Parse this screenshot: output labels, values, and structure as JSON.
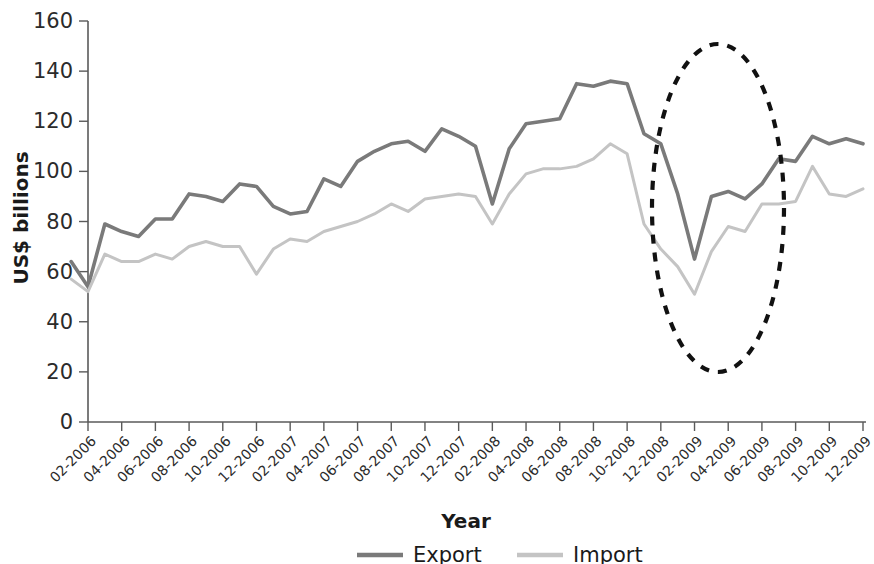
{
  "chart_data": {
    "type": "line",
    "title": "",
    "xlabel": "Year",
    "ylabel": "US$ billions",
    "ylim": [
      0,
      160
    ],
    "yticks": [
      0,
      20,
      40,
      60,
      80,
      100,
      120,
      140,
      160
    ],
    "grid": false,
    "legend_position": "bottom",
    "x": [
      "01-2006",
      "02-2006",
      "03-2006",
      "04-2006",
      "05-2006",
      "06-2006",
      "07-2006",
      "08-2006",
      "09-2006",
      "10-2006",
      "11-2006",
      "12-2006",
      "01-2007",
      "02-2007",
      "03-2007",
      "04-2007",
      "05-2007",
      "06-2007",
      "07-2007",
      "08-2007",
      "09-2007",
      "10-2007",
      "11-2007",
      "12-2007",
      "01-2008",
      "02-2008",
      "03-2008",
      "04-2008",
      "05-2008",
      "06-2008",
      "07-2008",
      "08-2008",
      "09-2008",
      "10-2008",
      "11-2008",
      "12-2008",
      "01-2009",
      "02-2009",
      "03-2009",
      "04-2009",
      "05-2009",
      "06-2009",
      "07-2009",
      "08-2009",
      "09-2009",
      "10-2009",
      "11-2009",
      "12-2009"
    ],
    "xtick_labels": [
      "02-2006",
      "04-2006",
      "06-2006",
      "08-2006",
      "10-2006",
      "12-2006",
      "02-2007",
      "04-2007",
      "06-2007",
      "08-2007",
      "10-2007",
      "12-2007",
      "02-2008",
      "04-2008",
      "06-2008",
      "08-2008",
      "10-2008",
      "12-2008",
      "02-2009",
      "04-2009",
      "06-2009",
      "08-2009",
      "10-2009",
      "12-2009"
    ],
    "series": [
      {
        "name": "Export",
        "color": "#7a7a7a",
        "values": [
          64,
          54,
          79,
          76,
          74,
          81,
          81,
          91,
          90,
          88,
          95,
          94,
          86,
          83,
          84,
          97,
          94,
          104,
          108,
          111,
          112,
          108,
          117,
          114,
          110,
          87,
          109,
          119,
          120,
          121,
          135,
          134,
          136,
          135,
          115,
          111,
          91,
          65,
          90,
          92,
          89,
          95,
          105,
          104,
          114,
          111,
          113,
          111
        ]
      },
      {
        "name": "Import",
        "color": "#c4c4c4",
        "values": [
          57,
          52,
          67,
          64,
          64,
          67,
          65,
          70,
          72,
          70,
          70,
          59,
          69,
          73,
          72,
          76,
          78,
          80,
          83,
          87,
          84,
          89,
          90,
          91,
          90,
          79,
          91,
          99,
          101,
          101,
          102,
          105,
          111,
          107,
          79,
          69,
          62,
          51,
          68,
          78,
          76,
          87,
          87,
          88,
          102,
          91,
          90,
          93
        ]
      }
    ]
  },
  "legend": {
    "items": [
      {
        "label": "Export",
        "color": "#7a7a7a"
      },
      {
        "label": "Import",
        "color": "#c4c4c4"
      }
    ]
  },
  "annotation": {
    "name": "crisis-highlight-ellipse",
    "style": "dashed-oval",
    "color": "#111111"
  }
}
